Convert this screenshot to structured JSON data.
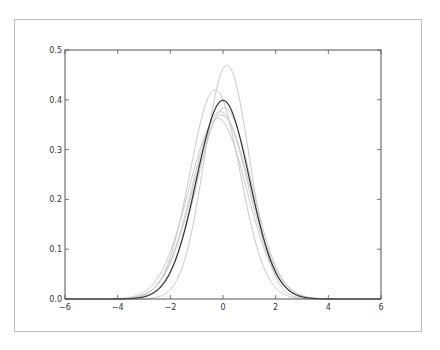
{
  "chart_data": {
    "type": "line",
    "title": "",
    "xlabel": "",
    "ylabel": "",
    "xlim": [
      -6,
      6
    ],
    "ylim": [
      0.0,
      0.5
    ],
    "xticks": [
      "−6",
      "−4",
      "−2",
      "0",
      "2",
      "4",
      "6"
    ],
    "yticks": [
      "0.0",
      "0.1",
      "0.2",
      "0.3",
      "0.4",
      "0.5"
    ],
    "grid": false,
    "legend": null,
    "series": [
      {
        "name": "standard normal pdf",
        "color": "#333333",
        "mu": 0.0,
        "sigma": 1.0,
        "peak": 0.399
      },
      {
        "name": "sample density 1",
        "color": "#c8c8c8",
        "mu": 0.15,
        "sigma": 0.85,
        "peak": 0.47
      },
      {
        "name": "sample density 2",
        "color": "#c8c8c8",
        "mu": -0.3,
        "sigma": 0.95,
        "peak": 0.42
      },
      {
        "name": "sample density 3",
        "color": "#c8c8c8",
        "mu": -0.1,
        "sigma": 1.06,
        "peak": 0.376
      },
      {
        "name": "sample density 4",
        "color": "#c8c8c8",
        "mu": -0.05,
        "sigma": 1.08,
        "peak": 0.369
      },
      {
        "name": "sample density 5",
        "color": "#c8c8c8",
        "mu": -0.2,
        "sigma": 1.1,
        "peak": 0.363
      },
      {
        "name": "sample density 6",
        "color": "#c8c8c8",
        "mu": 0.05,
        "sigma": 1.04,
        "peak": 0.384
      }
    ]
  }
}
